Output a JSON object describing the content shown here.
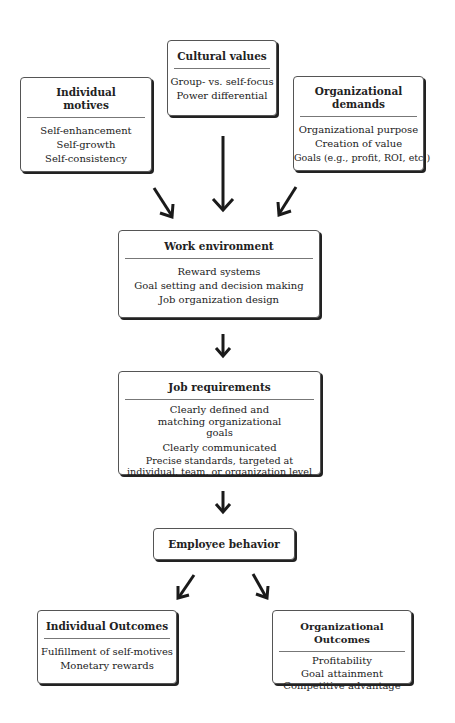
{
  "diagram": {
    "inputs": {
      "individual_motives": {
        "title": "Individual motives",
        "title_line1": "Individual",
        "title_line2": "motives",
        "items": [
          "Self-enhancement",
          "Self-growth",
          "Self-consistency"
        ]
      },
      "cultural_values": {
        "title": "Cultural values",
        "items": [
          "Group- vs. self-focus",
          "Power differential"
        ]
      },
      "organizational_demands": {
        "title": "Organizational demands",
        "title_line1": "Organizational",
        "title_line2": "demands",
        "items": [
          "Organizational purpose",
          "Creation of value",
          "Goals (e.g., profit, ROI, etc.)"
        ]
      }
    },
    "work_environment": {
      "title": "Work environment",
      "items": [
        "Reward systems",
        "Goal setting and decision making",
        "Job organization design"
      ]
    },
    "job_requirements": {
      "title": "Job requirements",
      "items": [
        "Clearly defined and matching organizational goals",
        "Clearly communicated",
        "Precise standards, targeted at individual, team, or organization level"
      ]
    },
    "employee_behavior": {
      "title": "Employee behavior"
    },
    "outcomes": {
      "individual": {
        "title": "Individual Outcomes",
        "items": [
          "Fulfillment of self-motives",
          "Monetary rewards"
        ]
      },
      "organizational": {
        "title": "Organizational Outcomes",
        "items": [
          "Profitability",
          "Goal attainment",
          "Competitive advantage"
        ]
      }
    }
  },
  "colors": {
    "border": "#555555",
    "shadow": "#222222",
    "arrow": "#1a1a1a",
    "background": "#ffffff"
  }
}
